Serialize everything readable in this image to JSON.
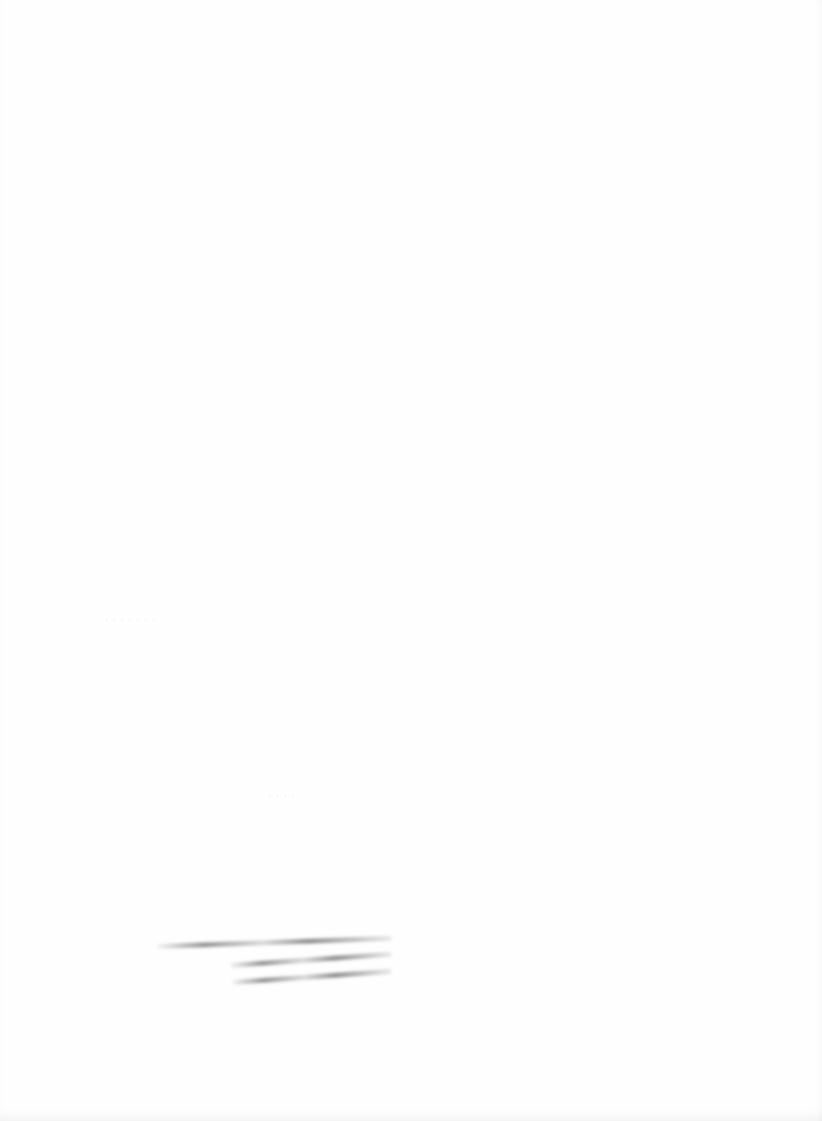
{
  "page": {
    "type": "scanned-blank-page",
    "background_color": "#fefefe",
    "ghost_marks": [
      {
        "text": "· · · · · · ·",
        "x": 105,
        "y": 614
      },
      {
        "text": "·  ·  ·  ·",
        "x": 268,
        "y": 790
      }
    ],
    "smudged_lines": [
      {
        "label": "illegible-handwriting-line-1",
        "x": 157,
        "y": 944,
        "width": 235,
        "angle": -2
      },
      {
        "label": "illegible-handwriting-line-2",
        "x": 230,
        "y": 963,
        "width": 162,
        "angle": -4
      },
      {
        "label": "illegible-handwriting-line-3",
        "x": 232,
        "y": 980,
        "width": 160,
        "angle": -4
      }
    ]
  }
}
